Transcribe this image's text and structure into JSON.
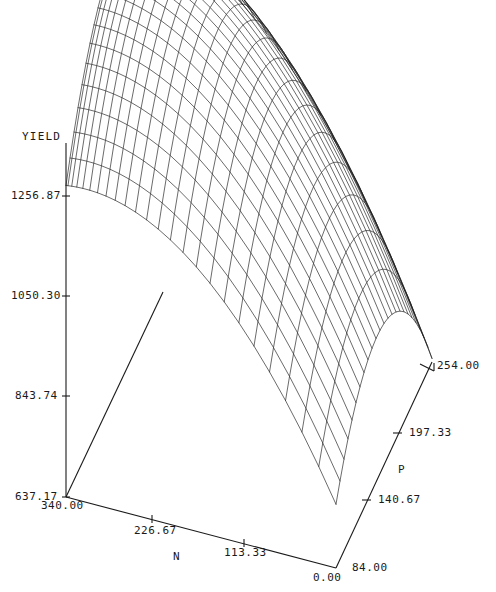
{
  "chart_data": {
    "type": "surface",
    "title": "",
    "zlabel": "YIELD",
    "xlabel": "N",
    "ylabel": "P",
    "z_ticks": [
      "1256.87",
      "1050.30",
      "843.74",
      "637.17"
    ],
    "z_tick_values": [
      1256.87,
      1050.3,
      843.74,
      637.17
    ],
    "zlim": [
      637.17,
      1256.87
    ],
    "x_ticks": [
      "340.00",
      "226.67",
      "113.33",
      "0.00"
    ],
    "x_tick_values": [
      340.0,
      226.67,
      113.33,
      0.0
    ],
    "xlim": [
      0.0,
      340.0
    ],
    "y_ticks": [
      "84.00",
      "140.67",
      "197.33",
      "254.00"
    ],
    "y_tick_values": [
      84.0,
      140.67,
      197.33,
      254.0
    ],
    "ylim": [
      84.0,
      254.0
    ],
    "grid": false,
    "legend": "none",
    "mesh_rows": 24,
    "mesh_cols": 24,
    "line_color": "#1a1a1a",
    "surface_description": "quadratic response surface peaking at high N and mid P, clipped at top of plot frame"
  },
  "zaxis": {
    "label": "YIELD",
    "ticks": [
      {
        "text": "1256.87"
      },
      {
        "text": "1050.30"
      },
      {
        "text": "843.74"
      },
      {
        "text": "637.17"
      }
    ]
  },
  "xaxis": {
    "label": "N",
    "ticks": [
      {
        "text": "340.00"
      },
      {
        "text": "226.67"
      },
      {
        "text": "113.33"
      },
      {
        "text": "0.00"
      }
    ]
  },
  "yaxis": {
    "label": "P",
    "ticks": [
      {
        "text": "84.00"
      },
      {
        "text": "140.67"
      },
      {
        "text": "197.33"
      },
      {
        "text": "254.00"
      }
    ]
  },
  "colors": {
    "ink": "#1a1a1a",
    "background": "#ffffff"
  }
}
